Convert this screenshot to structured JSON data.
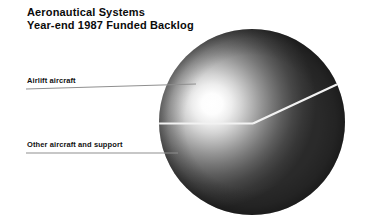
{
  "page": {
    "background_color": "#ffffff",
    "width": 368,
    "height": 223
  },
  "title": {
    "line1": "Aeronautical Systems",
    "line2": "Year-end 1987 Funded Backlog",
    "color": "#0b0b0b"
  },
  "callouts": [
    {
      "id": "airlift",
      "label": "Airlift aircraft",
      "leader_line": {
        "x1": 26,
        "y1": 89,
        "x2": 196,
        "y2": 84
      }
    },
    {
      "id": "other",
      "label": "Other aircraft and support",
      "leader_line": {
        "x1": 26,
        "y1": 153,
        "x2": 178,
        "y2": 153
      }
    }
  ],
  "sphere": {
    "center_x": 252,
    "center_y": 122,
    "radius": 93,
    "highlight_x": 212,
    "highlight_y": 104,
    "highlight_radius": 66,
    "body_color_light": "#b9b9b9",
    "body_color_dark": "#2b2b2b",
    "divider_color": "#f2f2f2"
  },
  "chart_data": {
    "type": "pie",
    "title": "Aeronautical Systems Year-end 1987 Funded Backlog",
    "subtitle": "",
    "xlabel": "",
    "ylabel": "",
    "legend_position": "left-callouts",
    "grid": false,
    "rendering": "shaded sphere with wedge cut",
    "categories": [
      "Airlift aircraft",
      "Other aircraft and support"
    ],
    "values": [
      43,
      57
    ],
    "slices": [
      {
        "name": "Airlift aircraft",
        "value": 43,
        "start_angle_deg": 25,
        "end_angle_deg": 180,
        "sweep_deg": 155
      },
      {
        "name": "Other aircraft and support",
        "value": 57,
        "start_angle_deg": 180,
        "end_angle_deg": 385,
        "sweep_deg": 205
      }
    ]
  }
}
